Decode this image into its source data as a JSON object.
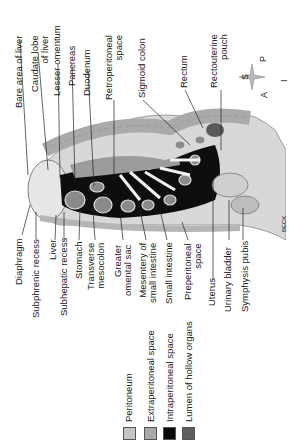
{
  "diagram": {
    "labels_top": [
      {
        "id": "bare-area-of-liver",
        "text": "Bare area of liver"
      },
      {
        "id": "caudate-lobe-of-liver",
        "text": "Caudate lobe\nof liver"
      },
      {
        "id": "lesser-omentum",
        "text": "Lesser omentum"
      },
      {
        "id": "pancreas",
        "text": "Pancreas"
      },
      {
        "id": "duodenum",
        "text": "Duodenum"
      },
      {
        "id": "retroperitoneal-space",
        "text": "Retroperitoneal\nspace"
      },
      {
        "id": "sigmoid-colon",
        "text": "Sigmoid colon"
      },
      {
        "id": "rectum",
        "text": "Rectum"
      },
      {
        "id": "rectouterine-pouch",
        "text": "Rectouterine\npouch"
      }
    ],
    "labels_bottom": [
      {
        "id": "diaphragm",
        "text": "Diaphragm"
      },
      {
        "id": "subphrenic-recess",
        "text": "Subphrenic recess"
      },
      {
        "id": "liver",
        "text": "Liver"
      },
      {
        "id": "subhepatic-recess",
        "text": "Subhepatic recess"
      },
      {
        "id": "stomach",
        "text": "Stomach"
      },
      {
        "id": "transverse-mesocolon",
        "text": "Transverse\nmesocolon"
      },
      {
        "id": "greater-omental-sac",
        "text": "Greater\nomental sac"
      },
      {
        "id": "mesentery-of-small-intestine",
        "text": "Mesentery of\nsmall intestine"
      },
      {
        "id": "small-intestine",
        "text": "Small intestine"
      },
      {
        "id": "preperitoneal-space",
        "text": "Preperitoneal\nspace"
      },
      {
        "id": "uterus",
        "text": "Uterus"
      },
      {
        "id": "urinary-bladder",
        "text": "Urinary bladder"
      },
      {
        "id": "symphysis-pubis",
        "text": "Symphysis pubis"
      }
    ],
    "compass": {
      "S": "S",
      "P": "P",
      "A": "A",
      "I": "I"
    },
    "signature": "BECK"
  },
  "legend": [
    {
      "label": "Peritoneum",
      "color": "#c4c4c4"
    },
    {
      "label": "Extraperitoneal space",
      "color": "#a9a9a9"
    },
    {
      "label": "Intraperitoneal space",
      "color": "#0a0a0a"
    },
    {
      "label": "Lumen of hollow organs",
      "color": "#5e5e5e"
    }
  ]
}
